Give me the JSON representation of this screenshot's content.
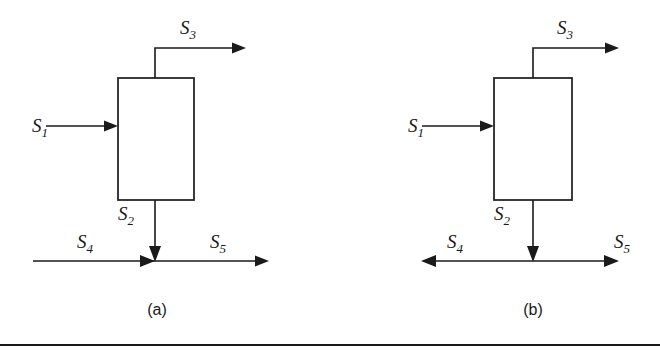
{
  "figure": {
    "background_color": "#ffffff",
    "line_color": "#1a1a1a",
    "width": 660,
    "height": 355
  },
  "panels": [
    {
      "id": "panel-a",
      "caption": "(a)",
      "caption_x": 157,
      "caption_y": 315,
      "unit_box": {
        "x": 118,
        "y": 78,
        "width": 76,
        "height": 122
      },
      "junction_style": "converging-inflow",
      "streams": [
        {
          "name": "S1",
          "label_base": "S",
          "label_sub": "1",
          "label_x": 48,
          "label_y": 132,
          "direction": "right",
          "role": "feed-inlet",
          "arrow_at": "box-left-edge"
        },
        {
          "name": "S3",
          "label_base": "S",
          "label_sub": "3",
          "label_x": 188,
          "label_y": 34,
          "direction": "up-then-right",
          "role": "overhead-outlet",
          "arrow_at": "right-end"
        },
        {
          "name": "S2",
          "label_base": "S",
          "label_sub": "2",
          "label_x": 126,
          "label_y": 220,
          "direction": "down",
          "role": "bottoms-outlet",
          "arrow_at": "junction"
        },
        {
          "name": "S4",
          "label_base": "S",
          "label_sub": "4",
          "label_x": 85,
          "label_y": 248,
          "direction": "right",
          "role": "side-inlet",
          "arrow_at": "junction"
        },
        {
          "name": "S5",
          "label_base": "S",
          "label_sub": "5",
          "label_x": 218,
          "label_y": 248,
          "direction": "right",
          "role": "combined-outlet",
          "arrow_at": "right-end"
        }
      ]
    },
    {
      "id": "panel-b",
      "caption": "(b)",
      "caption_x": 533,
      "caption_y": 315,
      "unit_box": {
        "x": 494,
        "y": 78,
        "width": 78,
        "height": 122
      },
      "junction_style": "bidirectional-split",
      "streams": [
        {
          "name": "S1",
          "label_base": "S",
          "label_sub": "1",
          "label_x": 424,
          "label_y": 132,
          "direction": "right",
          "role": "feed-inlet",
          "arrow_at": "box-left-edge"
        },
        {
          "name": "S3",
          "label_base": "S",
          "label_sub": "3",
          "label_x": 565,
          "label_y": 34,
          "direction": "up-then-right",
          "role": "overhead-outlet",
          "arrow_at": "right-end"
        },
        {
          "name": "S2",
          "label_base": "S",
          "label_sub": "2",
          "label_x": 502,
          "label_y": 220,
          "direction": "down",
          "role": "bottoms-outlet",
          "arrow_at": "junction"
        },
        {
          "name": "S4",
          "label_base": "S",
          "label_sub": "4",
          "label_x": 455,
          "label_y": 248,
          "direction": "left",
          "role": "side-outlet",
          "arrow_at": "left-end"
        },
        {
          "name": "S5",
          "label_base": "S",
          "label_sub": "5",
          "label_x": 622,
          "label_y": 248,
          "direction": "right",
          "role": "side-outlet",
          "arrow_at": "right-end"
        }
      ]
    }
  ],
  "rule": {
    "y": 345,
    "x_start": 0,
    "x_end": 660
  }
}
